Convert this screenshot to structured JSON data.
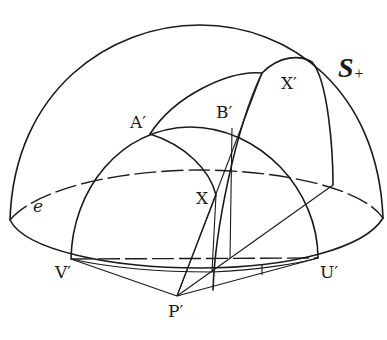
{
  "figure": {
    "stroke_color": "#1a1a1a",
    "background": "#ffffff"
  },
  "labels": {
    "surface": {
      "text": "S",
      "subscript": "+"
    },
    "ellipse": "e",
    "points": {
      "A_prime": "A′",
      "B_prime": "B′",
      "X": "X",
      "X_prime": "X′",
      "V_prime": "V′",
      "U_prime": "U′",
      "P_prime": "P′"
    }
  }
}
